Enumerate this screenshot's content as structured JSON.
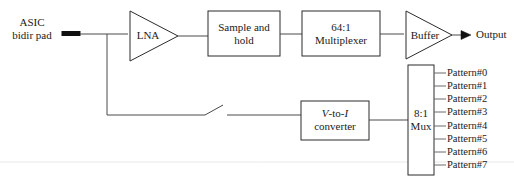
{
  "diagram": {
    "source_label": {
      "line1": "ASIC",
      "line2": "bidir pad"
    },
    "blocks": [
      {
        "id": "lna",
        "label": "LNA",
        "shape": "triangle"
      },
      {
        "id": "sample-and-hold",
        "label_line1": "Sample and",
        "label_line2": "hold",
        "shape": "rect"
      },
      {
        "id": "multiplexer-64-1",
        "label_line1": "64:1",
        "label_line2": "Multiplexer",
        "shape": "rect"
      },
      {
        "id": "buffer",
        "label": "Buffer",
        "shape": "triangle"
      },
      {
        "id": "v-to-i-converter",
        "label_line1_pre": "V",
        "label_line1_mid": "-to-",
        "label_line1_post": "I",
        "label_line2": "converter",
        "shape": "rect"
      },
      {
        "id": "mux-8-1",
        "label_line1": "8:1",
        "label_line2": "Mux",
        "shape": "rect"
      }
    ],
    "output_label": "Output",
    "pattern_inputs": [
      "Pattern#0",
      "Pattern#1",
      "Pattern#2",
      "Pattern#3",
      "Pattern#4",
      "Pattern#5",
      "Pattern#6",
      "Pattern#7"
    ],
    "switch": {
      "name": "open-switch",
      "state": "open"
    },
    "colors": {
      "line": "#2b2b2b",
      "wire": "#4a4a4a",
      "text": "#1a1a1a",
      "background": "#ffffff",
      "pad": "#111111"
    }
  }
}
